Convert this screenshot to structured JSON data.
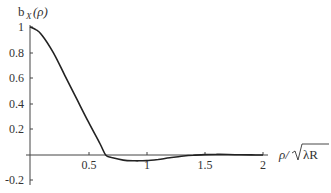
{
  "chart_data": {
    "type": "line",
    "title": "",
    "ylabel": "b_X(ρ)",
    "xlabel": "ρ/√λR",
    "xlim": [
      0,
      2
    ],
    "ylim": [
      -0.2,
      1
    ],
    "grid": false,
    "legend": "none",
    "x_ticks": [
      "0.5",
      "1",
      "1.5",
      "2"
    ],
    "y_ticks": [
      "1",
      "0.8",
      "0.6",
      "0.4",
      "0.2",
      "-0.2"
    ],
    "series": [
      {
        "name": "b_X(ρ)",
        "x": [
          0,
          0.05,
          0.1,
          0.2,
          0.3,
          0.4,
          0.5,
          0.6,
          0.65,
          0.7,
          0.8,
          0.9,
          0.95,
          1.0,
          1.1,
          1.2,
          1.3,
          1.4,
          1.5,
          1.6,
          1.7,
          1.8,
          1.9,
          2.0
        ],
        "values": [
          1.0,
          0.98,
          0.94,
          0.8,
          0.62,
          0.44,
          0.26,
          0.09,
          0.0,
          -0.02,
          -0.04,
          -0.045,
          -0.045,
          -0.044,
          -0.035,
          -0.022,
          -0.01,
          -0.002,
          0.003,
          0.005,
          0.004,
          0.002,
          0.001,
          0.0
        ]
      }
    ]
  },
  "labels": {
    "ylabel_main": "b",
    "ylabel_sub": "X",
    "ylabel_arg": "(ρ)",
    "xlabel_num": "ρ/",
    "xlabel_rad": "λR"
  }
}
